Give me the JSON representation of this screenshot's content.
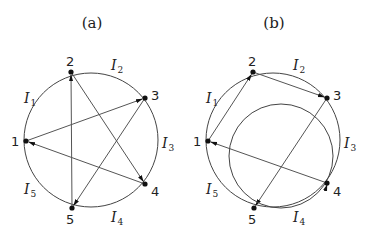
{
  "panels": [
    {
      "id": "a",
      "title": "(a)",
      "title_pos": [
        92,
        28
      ],
      "circle": {
        "cx": 91,
        "cy": 140,
        "r": 67
      },
      "nodes": [
        {
          "label": "1",
          "x": 26,
          "y": 141,
          "lx": 11,
          "ly": 146
        },
        {
          "label": "2",
          "x": 71,
          "y": 72,
          "lx": 66,
          "ly": 66
        },
        {
          "label": "3",
          "x": 145,
          "y": 98,
          "lx": 151,
          "ly": 100
        },
        {
          "label": "4",
          "x": 145,
          "y": 184,
          "lx": 151,
          "ly": 196
        },
        {
          "label": "5",
          "x": 72,
          "y": 208,
          "lx": 66,
          "ly": 224
        }
      ],
      "arc_labels": [
        {
          "label": "I",
          "sub": "1",
          "x": 24,
          "y": 103
        },
        {
          "label": "I",
          "sub": "2",
          "x": 111,
          "y": 70
        },
        {
          "label": "I",
          "sub": "3",
          "x": 162,
          "y": 148
        },
        {
          "label": "I",
          "sub": "4",
          "x": 111,
          "y": 222
        },
        {
          "label": "I",
          "sub": "5",
          "x": 24,
          "y": 194
        }
      ],
      "edges": [
        {
          "from": "5",
          "to": "2"
        },
        {
          "from": "2",
          "to": "4"
        },
        {
          "from": "4",
          "to": "1"
        },
        {
          "from": "1",
          "to": "3"
        },
        {
          "from": "3",
          "to": "5"
        }
      ]
    },
    {
      "id": "b",
      "title": "(b)",
      "title_pos": [
        274,
        28
      ],
      "circle": {
        "cx": 273,
        "cy": 140,
        "r": 67
      },
      "inner_circle": {
        "cx": 281,
        "cy": 156,
        "r": 52
      },
      "nodes": [
        {
          "label": "1",
          "x": 208,
          "y": 141,
          "lx": 193,
          "ly": 146
        },
        {
          "label": "2",
          "x": 253,
          "y": 72,
          "lx": 248,
          "ly": 66
        },
        {
          "label": "3",
          "x": 327,
          "y": 98,
          "lx": 333,
          "ly": 100
        },
        {
          "label": "4",
          "x": 327,
          "y": 183,
          "lx": 333,
          "ly": 196
        },
        {
          "label": "5",
          "x": 254,
          "y": 208,
          "lx": 248,
          "ly": 224
        }
      ],
      "arc_labels": [
        {
          "label": "I",
          "sub": "1",
          "x": 206,
          "y": 103
        },
        {
          "label": "I",
          "sub": "2",
          "x": 293,
          "y": 70
        },
        {
          "label": "I",
          "sub": "3",
          "x": 344,
          "y": 148
        },
        {
          "label": "I",
          "sub": "4",
          "x": 293,
          "y": 222
        },
        {
          "label": "I",
          "sub": "5",
          "x": 206,
          "y": 194
        }
      ],
      "edges": [
        {
          "from": "1",
          "to": "2"
        },
        {
          "from": "2",
          "to": "3"
        },
        {
          "from": "3",
          "to": "5"
        },
        {
          "from": "4",
          "to": "1"
        }
      ],
      "curved_edges": [
        {
          "from": "5",
          "to": "4",
          "via": "inner_circle"
        }
      ]
    }
  ]
}
